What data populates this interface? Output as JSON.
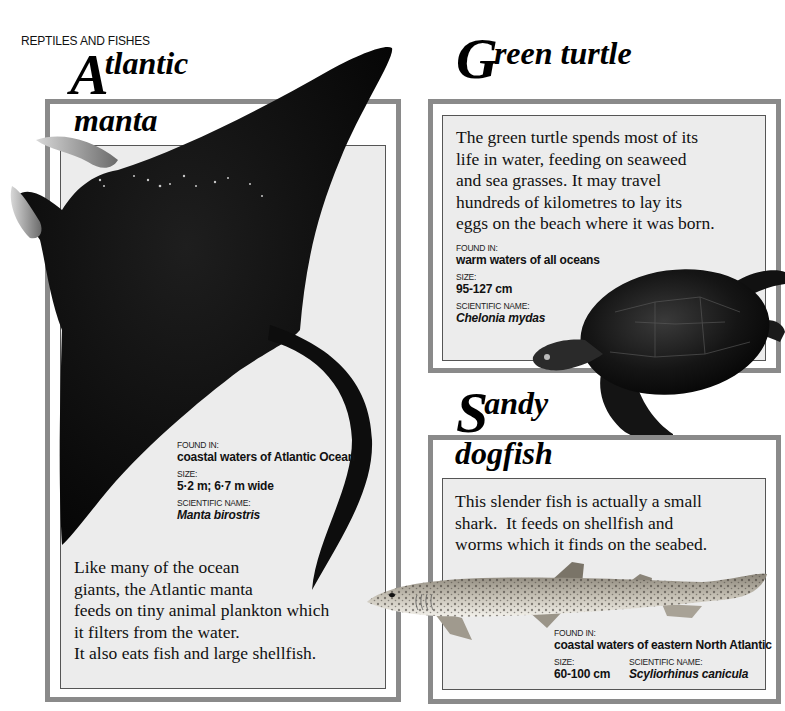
{
  "page": {
    "section_label": "REPTILES AND FISHES"
  },
  "manta": {
    "title_cap": "A",
    "title_rest": "tlantic",
    "title_line2": "manta",
    "description": [
      "Like many of the ocean",
      "giants, the Atlantic manta",
      "feeds on tiny animal plankton which",
      "it filters from the water.",
      "It also eats fish and large shellfish."
    ],
    "facts": {
      "found_in_label": "FOUND IN:",
      "found_in": "coastal waters of Atlantic Ocean",
      "size_label": "SIZE:",
      "size": "5·2 m; 6·7 m wide",
      "scientific_label": "SCIENTIFIC NAME:",
      "scientific_name": "Manta birostris"
    },
    "illustration": "manta-ray-illustration"
  },
  "turtle": {
    "title_cap": "G",
    "title_rest": "reen turtle",
    "description": [
      "The green turtle spends most of its",
      "life in water, feeding on seaweed",
      "and sea grasses. It may travel",
      "hundreds of kilometres to lay its",
      "eggs on the beach where it was born."
    ],
    "facts": {
      "found_in_label": "FOUND IN:",
      "found_in": "warm waters of all oceans",
      "size_label": "SIZE:",
      "size": "95-127 cm",
      "scientific_label": "SCIENTIFIC NAME:",
      "scientific_name": "Chelonia mydas"
    },
    "illustration": "green-turtle-illustration"
  },
  "dogfish": {
    "title_cap": "S",
    "title_rest": "andy",
    "title_line2": "dogfish",
    "description": [
      "This slender fish is actually a small",
      "shark.  It feeds on shellfish and",
      "worms which it finds on the seabed."
    ],
    "facts": {
      "found_in_label": "FOUND IN:",
      "found_in": "coastal waters of eastern North Atlantic",
      "size_label": "SIZE:",
      "size": "60-100 cm",
      "scientific_label": "SCIENTIFIC NAME:",
      "scientific_name": "Scyliorhinus canicula"
    },
    "illustration": "sandy-dogfish-illustration"
  },
  "colors": {
    "frame_outer": "#8a8a8a",
    "frame_inner_bg": "#ececec",
    "ink": "#111111",
    "animal_dark": "#0d0d0d"
  }
}
